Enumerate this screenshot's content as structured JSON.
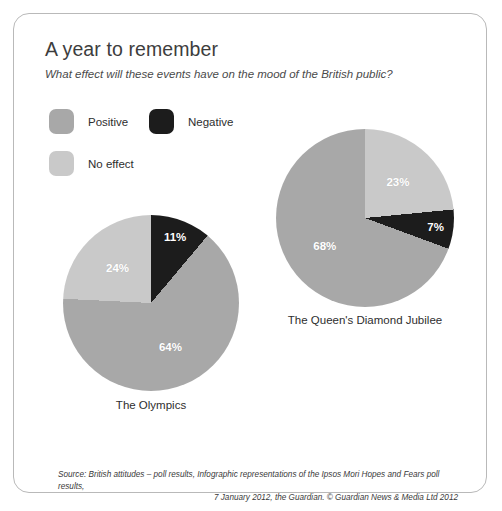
{
  "card": {
    "title": "A year to remember",
    "subtitle": "What effect will these events have on the mood of the British public?"
  },
  "legend": {
    "items": [
      {
        "label": "Positive",
        "color": "#a8a8a8",
        "key": "positive"
      },
      {
        "label": "Negative",
        "color": "#1c1c1c",
        "key": "negative"
      },
      {
        "label": "No effect",
        "color": "#c9c9c9",
        "key": "no-effect"
      }
    ]
  },
  "footer": {
    "line1": "Source: British attitudes – poll results, Infographic representations of the Ipsos Mori Hopes and Fears poll results,",
    "line2": "7 January 2012, the Guardian. © Guardian News & Media Ltd 2012"
  },
  "chart_data": [
    {
      "type": "pie",
      "title": "The Olympics",
      "categories": [
        "Negative",
        "Positive",
        "No effect"
      ],
      "values": [
        11,
        64,
        24
      ],
      "labels": [
        "11%",
        "64%",
        "24%"
      ],
      "colors": [
        "#1c1c1c",
        "#a8a8a8",
        "#c9c9c9"
      ],
      "unit": "%",
      "start_angle": 0,
      "direction": "clockwise",
      "label_color": "#ffffff"
    },
    {
      "type": "pie",
      "title": "The Queen's Diamond Jubilee",
      "categories": [
        "No effect",
        "Negative",
        "Positive"
      ],
      "values": [
        23,
        7,
        68
      ],
      "labels": [
        "23%",
        "7%",
        "68%"
      ],
      "colors": [
        "#c9c9c9",
        "#1c1c1c",
        "#a8a8a8"
      ],
      "unit": "%",
      "start_angle": 0,
      "direction": "clockwise",
      "label_color": "#ffffff"
    }
  ]
}
